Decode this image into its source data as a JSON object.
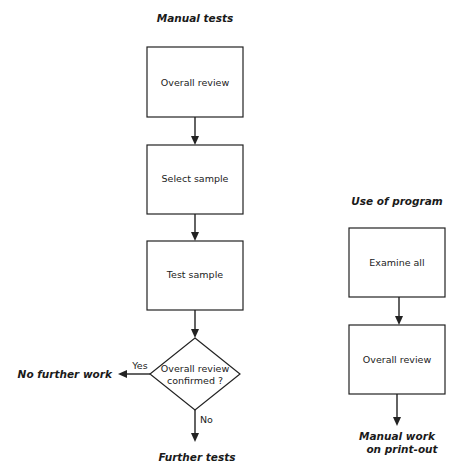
{
  "manual": {
    "title": "Manual tests",
    "steps": [
      "Overall review",
      "Select sample",
      "Test sample"
    ],
    "decision": {
      "line1": "Overall review",
      "line2": "confirmed ?"
    },
    "yes_label": "Yes",
    "no_label": "No",
    "yes_outcome": "No further work",
    "no_outcome": "Further tests"
  },
  "program": {
    "title": "Use of program",
    "steps": [
      "Examine all",
      "Overall review"
    ],
    "outcome_line1": "Manual work",
    "outcome_line2": "on print-out"
  }
}
